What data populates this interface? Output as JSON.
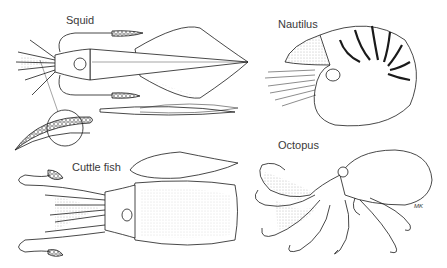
{
  "figure": {
    "panels": [
      {
        "id": "squid",
        "label": "Squid"
      },
      {
        "id": "nautilus",
        "label": "Nautilus"
      },
      {
        "id": "cuttlefish",
        "label": "Cuttle fish"
      },
      {
        "id": "octopus",
        "label": "Octopus"
      }
    ],
    "signature": "MK",
    "colors": {
      "line": "#1a1a1a",
      "background": "#ffffff",
      "stipple": "#888888"
    }
  }
}
